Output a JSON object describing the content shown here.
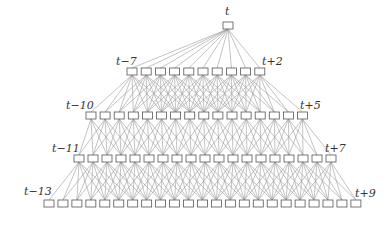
{
  "diagram": {
    "title": "",
    "line_color": "#9a9a9a",
    "box_stroke": "#555555",
    "box_fill": "#ffffff",
    "box_w": 10,
    "box_h": 7,
    "rows": [
      {
        "y": 22,
        "count": 1,
        "x0": 223,
        "pitch": 0,
        "left_label": "t",
        "right_label": ""
      },
      {
        "y": 68,
        "count": 10,
        "x0": 127,
        "pitch": 14.2,
        "left_label": "t−7",
        "right_label": "t+2"
      },
      {
        "y": 112,
        "count": 16,
        "x0": 86,
        "pitch": 14.1,
        "left_label": "t−10",
        "right_label": "t+5"
      },
      {
        "y": 155,
        "count": 19,
        "x0": 74,
        "pitch": 14.0,
        "left_label": "t−11",
        "right_label": "t+7"
      },
      {
        "y": 200,
        "count": 23,
        "x0": 44,
        "pitch": 13.95,
        "left_label": "t−13",
        "right_label": "t+9"
      }
    ],
    "labels": [
      {
        "id": "top",
        "text": "t",
        "x": 225,
        "y": 6
      },
      {
        "id": "row1-left",
        "text": "t−7",
        "x": 116,
        "y": 56
      },
      {
        "id": "row1-right",
        "text": "t+2",
        "x": 262,
        "y": 56
      },
      {
        "id": "row2-left",
        "text": "t−10",
        "x": 66,
        "y": 100
      },
      {
        "id": "row2-right",
        "text": "t+5",
        "x": 300,
        "y": 100
      },
      {
        "id": "row3-left",
        "text": "t−11",
        "x": 52,
        "y": 143
      },
      {
        "id": "row3-right",
        "text": "t+7",
        "x": 325,
        "y": 143
      },
      {
        "id": "row4-left",
        "text": "t−13",
        "x": 24,
        "y": 186
      },
      {
        "id": "row4-right",
        "text": "t+9",
        "x": 355,
        "y": 188
      }
    ]
  }
}
